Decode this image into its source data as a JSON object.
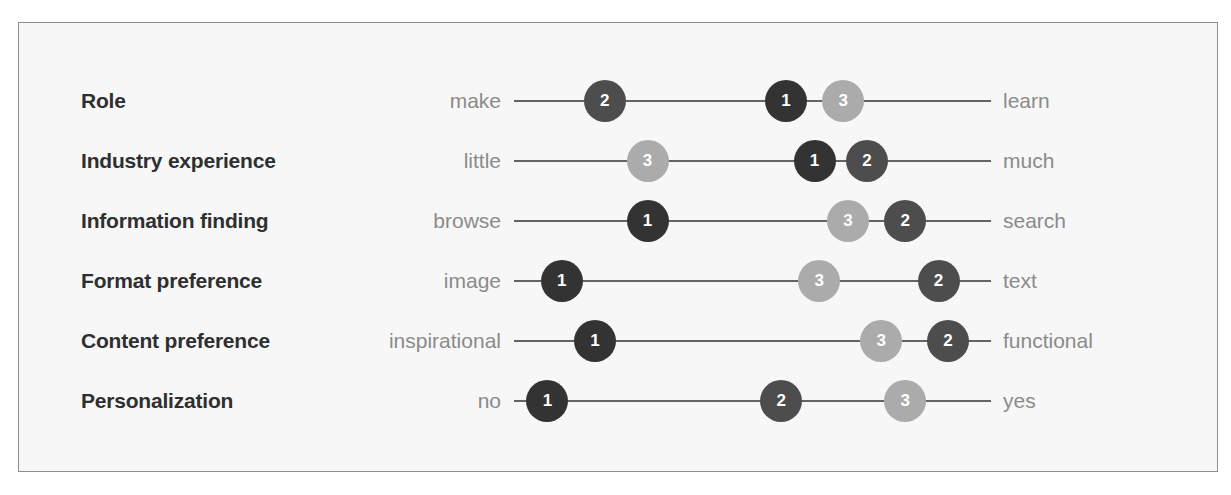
{
  "chart_data": {
    "type": "scatter",
    "title": "",
    "xlabel": "",
    "ylabel": "",
    "xlim": [
      0,
      100
    ],
    "grid": false,
    "legend": "none",
    "marker_colors": {
      "1": "#333333",
      "2": "#4d4d4d",
      "3": "#ababab"
    },
    "series": [
      {
        "name": "1",
        "values": [
          57,
          63,
          28,
          10,
          17,
          7
        ]
      },
      {
        "name": "2",
        "values": [
          19,
          74,
          82,
          89,
          91,
          56
        ]
      },
      {
        "name": "3",
        "values": [
          69,
          28,
          70,
          64,
          77,
          82
        ]
      }
    ],
    "categories": [
      "Role",
      "Industry experience",
      "Information finding",
      "Format preference",
      "Content preference",
      "Personalization"
    ],
    "rows": [
      {
        "label": "Role",
        "left_pole": "make",
        "right_pole": "learn",
        "markers": [
          {
            "id": "2",
            "value": 19
          },
          {
            "id": "1",
            "value": 57
          },
          {
            "id": "3",
            "value": 69
          }
        ]
      },
      {
        "label": "Industry experience",
        "left_pole": "little",
        "right_pole": "much",
        "markers": [
          {
            "id": "3",
            "value": 28
          },
          {
            "id": "1",
            "value": 63
          },
          {
            "id": "2",
            "value": 74
          }
        ]
      },
      {
        "label": "Information finding",
        "left_pole": "browse",
        "right_pole": "search",
        "markers": [
          {
            "id": "1",
            "value": 28
          },
          {
            "id": "3",
            "value": 70
          },
          {
            "id": "2",
            "value": 82
          }
        ]
      },
      {
        "label": "Format preference",
        "left_pole": "image",
        "right_pole": "text",
        "markers": [
          {
            "id": "1",
            "value": 10
          },
          {
            "id": "3",
            "value": 64
          },
          {
            "id": "2",
            "value": 89
          }
        ]
      },
      {
        "label": "Content preference",
        "left_pole": "inspirational",
        "right_pole": "functional",
        "markers": [
          {
            "id": "1",
            "value": 17
          },
          {
            "id": "3",
            "value": 77
          },
          {
            "id": "2",
            "value": 91
          }
        ]
      },
      {
        "label": "Personalization",
        "left_pole": "no",
        "right_pole": "yes",
        "markers": [
          {
            "id": "1",
            "value": 7
          },
          {
            "id": "2",
            "value": 56
          },
          {
            "id": "3",
            "value": 82
          }
        ]
      }
    ]
  }
}
